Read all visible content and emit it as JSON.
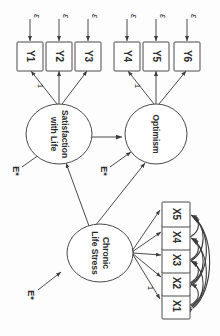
{
  "diagram": {
    "orientation": "rotated-90-ccw",
    "colors": {
      "stroke": "#4a4a4a",
      "text": "#2b2b2b",
      "background": "#fdfdfd"
    },
    "latents": [
      {
        "id": "satisfaction",
        "line1": "Satisfaction",
        "line2": "with Life"
      },
      {
        "id": "optimism",
        "line1": "Optimism",
        "line2": ""
      },
      {
        "id": "stress",
        "line1": "Chronic",
        "line2": "Life Stress"
      }
    ],
    "indicators_y": [
      {
        "id": "y1",
        "label": "Y1"
      },
      {
        "id": "y2",
        "label": "Y2"
      },
      {
        "id": "y3",
        "label": "Y3"
      },
      {
        "id": "y4",
        "label": "Y4"
      },
      {
        "id": "y5",
        "label": "Y5"
      },
      {
        "id": "y6",
        "label": "Y6"
      }
    ],
    "indicators_x": [
      {
        "id": "x1",
        "label": "X1"
      },
      {
        "id": "x2",
        "label": "X2"
      },
      {
        "id": "x3",
        "label": "X3"
      },
      {
        "id": "x4",
        "label": "X4"
      },
      {
        "id": "x5",
        "label": "X5"
      }
    ],
    "measurement_errors": [
      {
        "id": "eps1",
        "label": "ε"
      },
      {
        "id": "eps2",
        "label": "ε"
      },
      {
        "id": "eps3",
        "label": "ε"
      },
      {
        "id": "eps4",
        "label": "ε"
      },
      {
        "id": "eps5",
        "label": "ε"
      },
      {
        "id": "eps6",
        "label": "ε"
      }
    ],
    "disturbances": [
      {
        "id": "e-satisfaction",
        "label": "E*"
      },
      {
        "id": "e-optimism",
        "label": "E*"
      },
      {
        "id": "e-stress",
        "label": "E*"
      }
    ],
    "fixed_loadings": [
      {
        "id": "one-y1",
        "label": "1"
      },
      {
        "id": "one-y4",
        "label": "1"
      },
      {
        "id": "one-x1",
        "label": "1"
      }
    ]
  }
}
